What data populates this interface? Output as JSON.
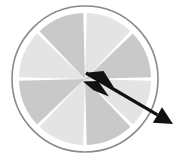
{
  "image": {
    "title": "Spinner wheel with arrow pointer",
    "width": 188,
    "height": 167,
    "background_color": "#ffffff"
  },
  "wheel": {
    "label": "Spinner wheel",
    "center_x": 85,
    "center_y": 79,
    "rim_radius": 73,
    "rim_color": "#8a8a8a",
    "rim_stroke_width": 1.6,
    "rim_gap_color": "#ffffff",
    "face_radius": 66,
    "segment_count": 8,
    "segment_gap_degrees": 3,
    "rotation_offset_degrees": -90,
    "divider_color": "#ffffff",
    "segment_colors": [
      "#e4e4e4",
      "#c9c9c9"
    ],
    "segments": [
      {
        "index": 1,
        "label": "segment-1",
        "start_deg": 0,
        "end_deg": 45,
        "color": "#e4e4e4"
      },
      {
        "index": 2,
        "label": "segment-2",
        "start_deg": 45,
        "end_deg": 90,
        "color": "#c9c9c9"
      },
      {
        "index": 3,
        "label": "segment-3",
        "start_deg": 90,
        "end_deg": 135,
        "color": "#e4e4e4"
      },
      {
        "index": 4,
        "label": "segment-4",
        "start_deg": 135,
        "end_deg": 180,
        "color": "#c9c9c9"
      },
      {
        "index": 5,
        "label": "segment-5",
        "start_deg": 180,
        "end_deg": 225,
        "color": "#e4e4e4"
      },
      {
        "index": 6,
        "label": "segment-6",
        "start_deg": 225,
        "end_deg": 270,
        "color": "#c9c9c9"
      },
      {
        "index": 7,
        "label": "segment-7",
        "start_deg": 270,
        "end_deg": 315,
        "color": "#e4e4e4"
      },
      {
        "index": 8,
        "label": "segment-8",
        "start_deg": 315,
        "end_deg": 360,
        "color": "#c9c9c9"
      }
    ]
  },
  "arrow": {
    "label": "Arrow pointer",
    "color": "#111111",
    "tail_x": 86,
    "tail_y": 73,
    "tip_x": 173,
    "tip_y": 124,
    "angle_degrees": 30,
    "shaft_width": 3.2,
    "head": {
      "label": "arrowhead",
      "length": 18,
      "half_width": 9
    },
    "fletching": [
      {
        "label": "fletch-upper",
        "cx": 101,
        "cy": 80,
        "length": 30,
        "half_width": 9,
        "tilt_deg": 30
      },
      {
        "label": "fletch-lower",
        "cx": 96,
        "cy": 89,
        "length": 30,
        "half_width": 8,
        "tilt_deg": 30
      }
    ]
  }
}
